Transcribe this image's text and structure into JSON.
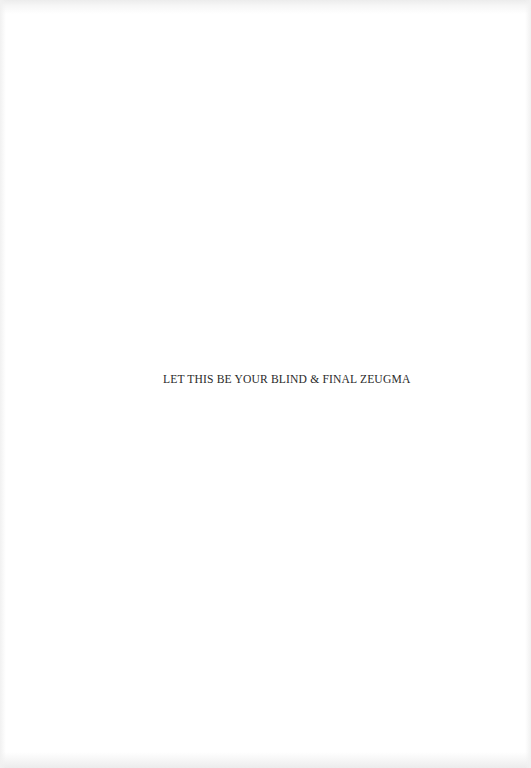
{
  "page": {
    "background": "#ffffff",
    "text_color": "#2a2a2a",
    "line": "LET THIS BE YOUR BLIND & FINAL ZEUGMA"
  }
}
